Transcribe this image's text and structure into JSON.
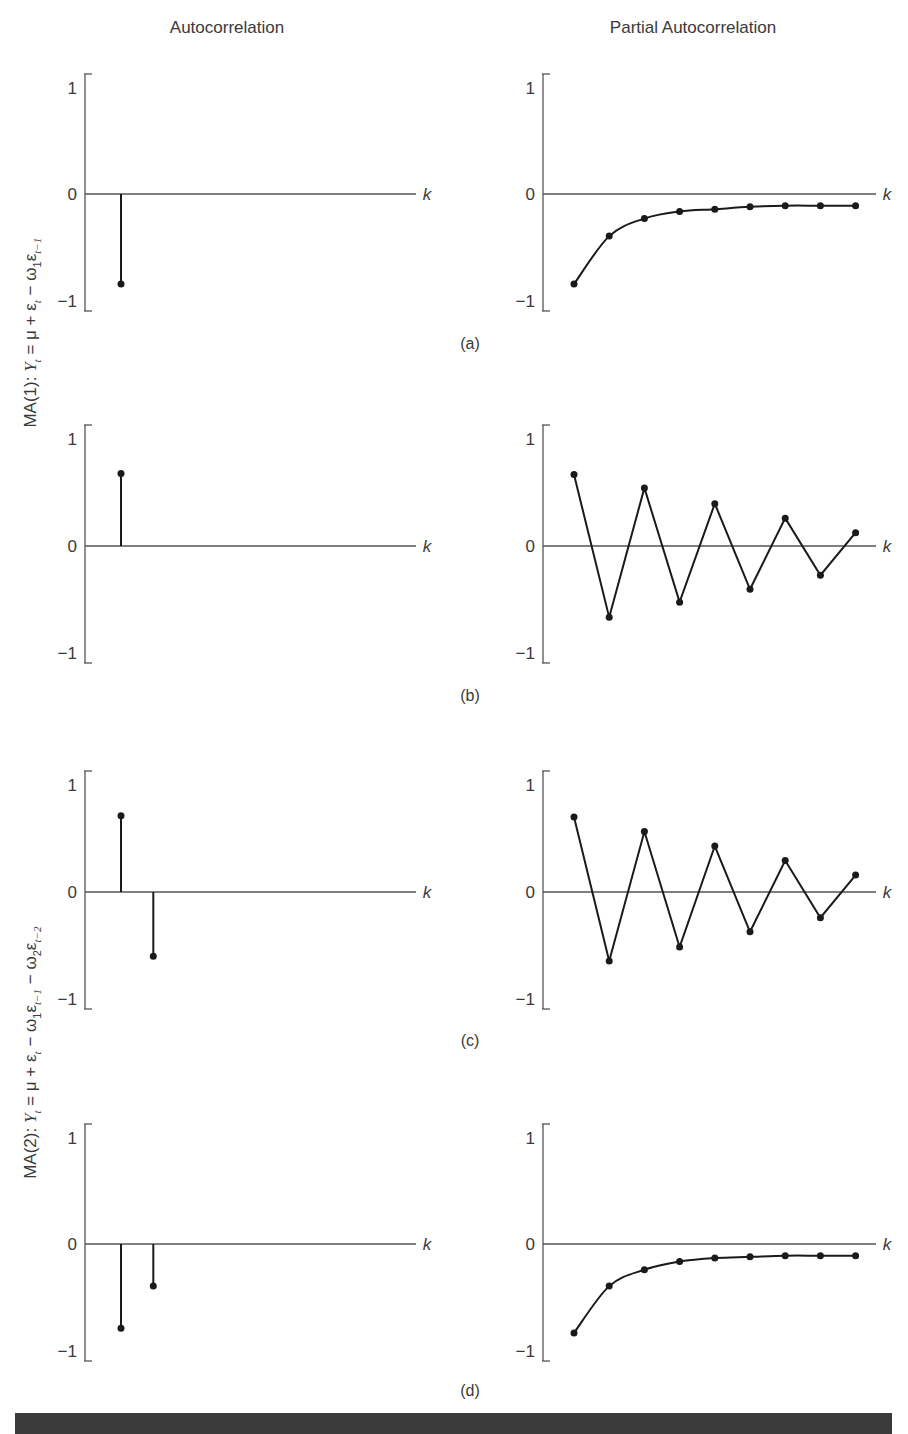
{
  "columns": {
    "left_title": "Autocorrelation",
    "right_title": "Partial Autocorrelation"
  },
  "models": [
    {
      "name": "MA(1)",
      "equation_text": "MA(1): Y_t = μ + ε_t − ω_1 ε_{t−1}",
      "prefix": "MA(1): ",
      "Y": "Y",
      "t": "t",
      "eq": " = μ + ε",
      "minus1": " − ω",
      "one": "1",
      "eps": "ε",
      "tm1": "t−1"
    },
    {
      "name": "MA(2)",
      "equation_text": "MA(2): Y_t = μ + ε_t − ω_1 ε_{t−1} − ω_2 ε_{t−2}",
      "prefix": "MA(2): ",
      "Y": "Y",
      "t": "t",
      "eq": " = μ + ε",
      "minus1": " − ω",
      "one": "1",
      "eps": "ε",
      "tm1": "t−1",
      "minus2": " − ω",
      "two": "2",
      "tm2": "t−2"
    }
  ],
  "panel_labels": [
    "(a)",
    "(b)",
    "(c)",
    "(d)"
  ],
  "axis": {
    "tick_top": "1",
    "tick_mid": "0",
    "tick_bottom": "−1",
    "x_label": "k"
  },
  "colors": {
    "axis": "#555555",
    "data": "#1a1a1a",
    "bar": "#3b3b3b"
  },
  "chart_data": [
    {
      "panel": "(a)",
      "side": "left",
      "type": "bar",
      "title": "Autocorrelation",
      "model": "MA(1)",
      "xlabel": "k",
      "ylim": [
        -1,
        1
      ],
      "yticks": [
        1,
        0,
        -1
      ],
      "style": "stem",
      "x": [
        1
      ],
      "values": [
        -0.77
      ]
    },
    {
      "panel": "(a)",
      "side": "right",
      "type": "line",
      "title": "Partial Autocorrelation",
      "model": "MA(1)",
      "xlabel": "k",
      "ylim": [
        -1,
        1
      ],
      "yticks": [
        1,
        0,
        -1
      ],
      "style": "smooth",
      "x": [
        1,
        2,
        3,
        4,
        5,
        6,
        7,
        8,
        9
      ],
      "values": [
        -0.77,
        -0.36,
        -0.21,
        -0.15,
        -0.13,
        -0.11,
        -0.1,
        -0.1,
        -0.1
      ]
    },
    {
      "panel": "(b)",
      "side": "left",
      "type": "bar",
      "title": "Autocorrelation",
      "model": "MA(1)",
      "xlabel": "k",
      "ylim": [
        -1,
        1
      ],
      "yticks": [
        1,
        0,
        -1
      ],
      "style": "stem",
      "x": [
        1
      ],
      "values": [
        0.6
      ]
    },
    {
      "panel": "(b)",
      "side": "right",
      "type": "line",
      "title": "Partial Autocorrelation",
      "model": "MA(1)",
      "xlabel": "k",
      "ylim": [
        -1,
        1
      ],
      "yticks": [
        1,
        0,
        -1
      ],
      "style": "zigzag",
      "x": [
        1,
        2,
        3,
        4,
        5,
        6,
        7,
        8,
        9
      ],
      "values": [
        0.59,
        -0.61,
        0.48,
        -0.48,
        0.35,
        -0.37,
        0.23,
        -0.25,
        0.11
      ]
    },
    {
      "panel": "(c)",
      "side": "left",
      "type": "bar",
      "title": "Autocorrelation",
      "model": "MA(2)",
      "xlabel": "k",
      "ylim": [
        -1,
        1
      ],
      "yticks": [
        1,
        0,
        -1
      ],
      "style": "stem",
      "x": [
        1,
        2
      ],
      "values": [
        0.63,
        -0.55
      ]
    },
    {
      "panel": "(c)",
      "side": "right",
      "type": "line",
      "title": "Partial Autocorrelation",
      "model": "MA(2)",
      "xlabel": "k",
      "ylim": [
        -1,
        1
      ],
      "yticks": [
        1,
        0,
        -1
      ],
      "style": "zigzag",
      "x": [
        1,
        2,
        3,
        4,
        5,
        6,
        7,
        8,
        9
      ],
      "values": [
        0.62,
        -0.59,
        0.5,
        -0.47,
        0.38,
        -0.34,
        0.26,
        -0.22,
        0.14
      ]
    },
    {
      "panel": "(d)",
      "side": "left",
      "type": "bar",
      "title": "Autocorrelation",
      "model": "MA(2)",
      "xlabel": "k",
      "ylim": [
        -1,
        1
      ],
      "yticks": [
        1,
        0,
        -1
      ],
      "style": "stem",
      "x": [
        1,
        2
      ],
      "values": [
        -0.72,
        -0.36
      ]
    },
    {
      "panel": "(d)",
      "side": "right",
      "type": "line",
      "title": "Partial Autocorrelation",
      "model": "MA(2)",
      "xlabel": "k",
      "ylim": [
        -1,
        1
      ],
      "yticks": [
        1,
        0,
        -1
      ],
      "style": "smooth",
      "x": [
        1,
        2,
        3,
        4,
        5,
        6,
        7,
        8,
        9
      ],
      "values": [
        -0.76,
        -0.36,
        -0.22,
        -0.15,
        -0.12,
        -0.11,
        -0.1,
        -0.1,
        -0.1
      ]
    }
  ]
}
